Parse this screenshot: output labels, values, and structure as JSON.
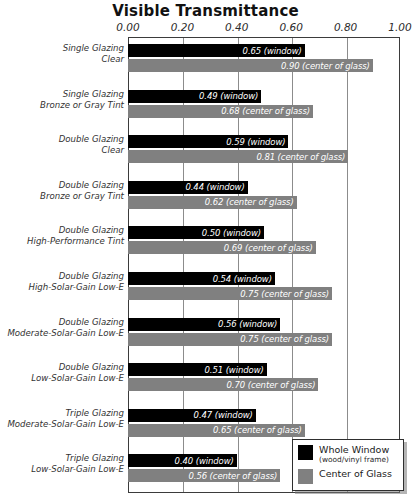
{
  "chart_data": {
    "type": "bar",
    "orientation": "horizontal",
    "title": "Visible Transmittance",
    "xlabel": "",
    "ylabel": "",
    "xlim": [
      0.0,
      1.0
    ],
    "grid": true,
    "grid_axis": "x",
    "legend_position": "bottom-right",
    "tick_labels": [
      "0.00",
      "0.20",
      "0.40",
      "0.60",
      "0.80",
      "1.00"
    ],
    "tick_values": [
      0.0,
      0.2,
      0.4,
      0.6,
      0.8,
      1.0
    ],
    "categories": [
      "Single Glazing Clear",
      "Single Glazing Bronze or Gray Tint",
      "Double Glazing Clear",
      "Double Glazing Bronze or Gray Tint",
      "Double Glazing High-Performance Tint",
      "Double Glazing High-Solar-Gain Low-E",
      "Double Glazing Moderate-Solar-Gain Low-E",
      "Double Glazing Low-Solar-Gain Low-E",
      "Triple Glazing Moderate-Solar-Gain Low-E",
      "Triple Glazing Low-Solar-Gain Low-E"
    ],
    "category_lines": [
      [
        "Single Glazing",
        "Clear"
      ],
      [
        "Single Glazing",
        "Bronze or Gray Tint"
      ],
      [
        "Double Glazing",
        "Clear"
      ],
      [
        "Double Glazing",
        "Bronze or Gray Tint"
      ],
      [
        "Double Glazing",
        "High-Performance Tint"
      ],
      [
        "Double Glazing",
        "High-Solar-Gain Low-E"
      ],
      [
        "Double Glazing",
        "Moderate-Solar-Gain Low-E"
      ],
      [
        "Double Glazing",
        "Low-Solar-Gain Low-E"
      ],
      [
        "Triple Glazing",
        "Moderate-Solar-Gain Low-E"
      ],
      [
        "Triple Glazing",
        "Low-Solar-Gain Low-E"
      ]
    ],
    "series": [
      {
        "name": "Whole Window",
        "color": "#000000",
        "values": [
          0.65,
          0.49,
          0.59,
          0.44,
          0.5,
          0.54,
          0.56,
          0.51,
          0.47,
          0.4
        ],
        "labels": [
          "0.65 (window)",
          "0.49 (window)",
          "0.59 (window)",
          "0.44 (window)",
          "0.50 (window)",
          "0.54 (window)",
          "0.56 (window)",
          "0.51 (window)",
          "0.47 (window)",
          "0.40 (window)"
        ]
      },
      {
        "name": "Center of Glass",
        "color": "#808080",
        "values": [
          0.9,
          0.68,
          0.81,
          0.62,
          0.69,
          0.75,
          0.75,
          0.7,
          0.65,
          0.56
        ],
        "labels": [
          "0.90 (center of glass)",
          "0.68 (center of glass)",
          "0.81 (center of glass)",
          "0.62 (center of glass)",
          "0.69 (center of glass)",
          "0.75 (center of glass)",
          "0.75 (center of glass)",
          "0.70 (center of glass)",
          "0.65 (center of glass)",
          "0.56 (center of glass)"
        ]
      }
    ]
  },
  "legend": {
    "items": [
      {
        "label": "Whole Window",
        "sublabel": "(wood/vinyl frame)",
        "color": "#000000"
      },
      {
        "label": "Center of Glass",
        "sublabel": "",
        "color": "#808080"
      }
    ]
  }
}
